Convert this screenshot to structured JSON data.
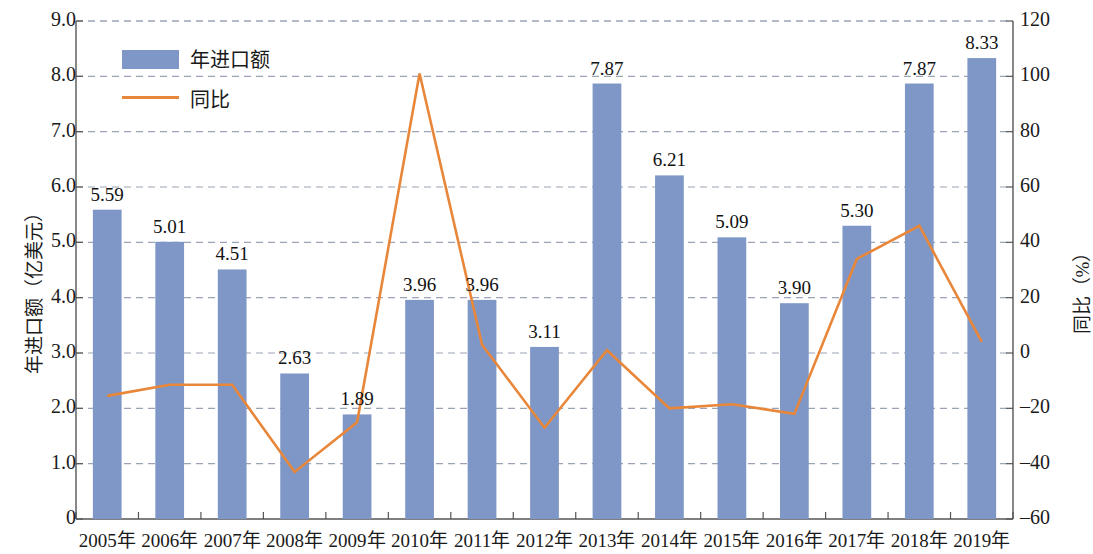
{
  "chart_data": {
    "type": "bar",
    "title": "",
    "xlabel": "",
    "ylabel": "年进口额（亿美元）",
    "ylabel_right": "同比（%）",
    "categories": [
      "2005年",
      "2006年",
      "2007年",
      "2008年",
      "2009年",
      "2010年",
      "2011年",
      "2012年",
      "2013年",
      "2014年",
      "2015年",
      "2016年",
      "2017年",
      "2018年",
      "2019年"
    ],
    "ylim": [
      0,
      9
    ],
    "ylim_right": [
      -60,
      120
    ],
    "yticks": [
      "0",
      "1.0",
      "2.0",
      "3.0",
      "4.0",
      "5.0",
      "6.0",
      "7.0",
      "8.0",
      "9.0"
    ],
    "ytick_values": [
      0,
      1,
      2,
      3,
      4,
      5,
      6,
      7,
      8,
      9
    ],
    "yticks_right": [
      "-60",
      "-40",
      "-20",
      "0",
      "20",
      "40",
      "60",
      "80",
      "100",
      "120"
    ],
    "ytick_right_values": [
      -60,
      -40,
      -20,
      0,
      20,
      40,
      60,
      80,
      100,
      120
    ],
    "grid": true,
    "legend_position": "upper-left",
    "series": [
      {
        "name": "年进口额",
        "type": "bar",
        "color": "#7f97c6",
        "axis": "left",
        "values": [
          5.59,
          5.01,
          4.51,
          2.63,
          1.89,
          3.96,
          3.96,
          3.11,
          7.87,
          6.21,
          5.09,
          3.9,
          5.3,
          7.87,
          8.33
        ],
        "labels": [
          "5.59",
          "5.01",
          "4.51",
          "2.63",
          "1.89",
          "3.96",
          "3.96",
          "3.11",
          "7.87",
          "6.21",
          "5.09",
          "3.90",
          "5.30",
          "7.87",
          "8.33"
        ]
      },
      {
        "name": "同比",
        "type": "line",
        "color": "#e8873a",
        "axis": "right",
        "values": [
          -15.5,
          -11.5,
          -11.5,
          -43.0,
          -25.0,
          101.0,
          3.0,
          -27.0,
          1.0,
          -20.0,
          -18.5,
          -22.0,
          34.0,
          46.0,
          4.0
        ]
      }
    ]
  },
  "legend": {
    "items": [
      {
        "label": "年进口额",
        "marker": "bar",
        "color": "#7f97c6"
      },
      {
        "label": "同比",
        "marker": "line",
        "color": "#e8873a"
      }
    ]
  },
  "axes": {
    "left_title": "年进口额（亿美元）",
    "right_title": "同比（%）"
  }
}
